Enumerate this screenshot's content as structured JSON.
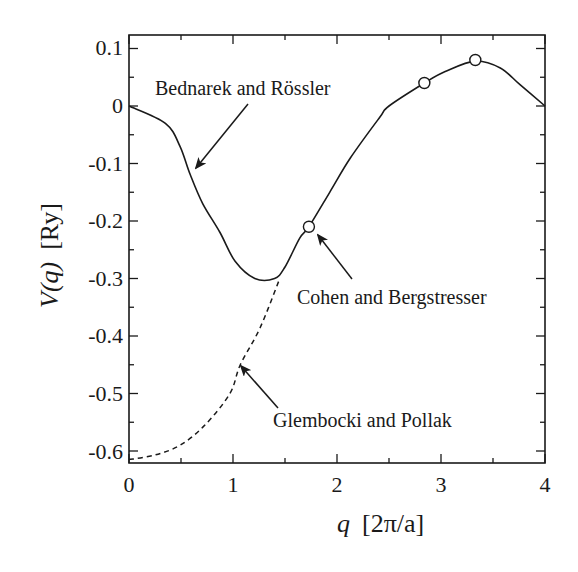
{
  "chart_data": {
    "type": "line",
    "title": "",
    "xlabel": "q  [2π/a]",
    "ylabel": "V(q)  [Ry]",
    "xlim": [
      0,
      4
    ],
    "ylim": [
      -0.62,
      0.12
    ],
    "x_ticks": [
      "0",
      "1",
      "2",
      "3",
      "4"
    ],
    "y_ticks": [
      "0.1",
      "0",
      "-0.1",
      "-0.2",
      "-0.3",
      "-0.4",
      "-0.5",
      "-0.6"
    ],
    "grid": false,
    "series": [
      {
        "name": "Bednarek and Rössler",
        "style": "solid",
        "x": [
          0,
          0.35,
          0.49,
          0.59,
          0.71,
          0.875,
          1.02,
          1.21,
          1.4,
          1.5,
          1.64,
          1.73,
          1.93,
          2.13,
          2.41,
          2.5,
          2.84,
          3.04,
          3.33,
          3.57,
          3.76,
          4.0
        ],
        "y": [
          0,
          -0.03,
          -0.07,
          -0.12,
          -0.17,
          -0.22,
          -0.27,
          -0.3,
          -0.3,
          -0.28,
          -0.23,
          -0.21,
          -0.15,
          -0.09,
          -0.02,
          0.0,
          0.04,
          0.06,
          0.078,
          0.066,
          0.037,
          0.0
        ]
      },
      {
        "name": "Glembocki and Pollak",
        "style": "dashed",
        "x": [
          0,
          0.25,
          0.49,
          0.73,
          0.97,
          1.07,
          1.26,
          1.45
        ],
        "y": [
          -0.615,
          -0.607,
          -0.59,
          -0.555,
          -0.5,
          -0.45,
          -0.386,
          -0.3
        ]
      },
      {
        "name": "Cohen and Bergstresser",
        "style": "open-circle-markers",
        "x": [
          1.73,
          2.84,
          3.33
        ],
        "y": [
          -0.21,
          0.04,
          0.08
        ]
      }
    ],
    "annotations": [
      {
        "text": "Bednarek and Rössler",
        "points_to": "solid curve near q≈0.65"
      },
      {
        "text": "Cohen and Bergstresser",
        "points_to": "circle at q≈1.73"
      },
      {
        "text": "Glembocki and Pollak",
        "points_to": "dashed curve near q≈1.07"
      }
    ]
  },
  "labels": {
    "xlabel_q": "q",
    "xlabel_unit": "[2π/a]",
    "ylabel_v": "V(q)",
    "ylabel_unit": "[Ry]",
    "annot_bednarek": "Bednarek and Rössler",
    "annot_cohen": "Cohen and Bergstresser",
    "annot_glembocki": "Glembocki and Pollak",
    "xt0": "0",
    "xt1": "1",
    "xt2": "2",
    "xt3": "3",
    "xt4": "4",
    "yt0": "0.1",
    "yt1": "0",
    "yt2": "-0.1",
    "yt3": "-0.2",
    "yt4": "-0.3",
    "yt5": "-0.4",
    "yt6": "-0.5",
    "yt7": "-0.6"
  }
}
